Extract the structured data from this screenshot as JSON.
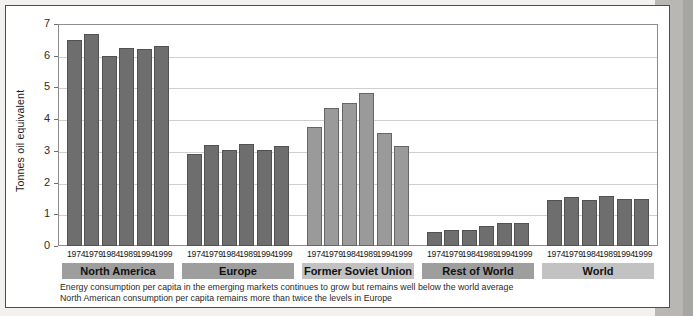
{
  "chart_data": {
    "type": "bar",
    "title": "",
    "xlabel": "",
    "ylabel": "Tonnes oil equivalent",
    "ylim": [
      0,
      7
    ],
    "yticks": [
      "0",
      "1",
      "2",
      "3",
      "4",
      "5",
      "6",
      "7"
    ],
    "grid": true,
    "legend": "none",
    "categories": [
      "1974",
      "1979",
      "1984",
      "1989",
      "1994",
      "1999"
    ],
    "groups": [
      {
        "name": "North America",
        "color": "#6e6e6e",
        "band_color": "#9e9e9e",
        "values": [
          6.5,
          6.7,
          6.0,
          6.25,
          6.2,
          6.3
        ]
      },
      {
        "name": "Europe",
        "color": "#6e6e6e",
        "band_color": "#9e9e9e",
        "values": [
          2.9,
          3.18,
          3.03,
          3.22,
          3.02,
          3.16
        ]
      },
      {
        "name": "Former Soviet Union",
        "color": "#9a9a9a",
        "band_color": "#c2c2c2",
        "values": [
          3.74,
          4.34,
          4.52,
          4.83,
          3.55,
          3.15
        ]
      },
      {
        "name": "Rest of World",
        "color": "#6e6e6e",
        "band_color": "#9e9e9e",
        "values": [
          0.45,
          0.5,
          0.52,
          0.62,
          0.72,
          0.72
        ]
      },
      {
        "name": "World",
        "color": "#6e6e6e",
        "band_color": "#c2c2c2",
        "values": [
          1.46,
          1.56,
          1.45,
          1.58,
          1.48,
          1.48
        ]
      }
    ]
  },
  "caption": {
    "line1": "Energy consumption per capita in the emerging markets continues to grow but remains well below the world average",
    "line2": "North American consumption per capita remains more than twice the levels in Europe"
  }
}
